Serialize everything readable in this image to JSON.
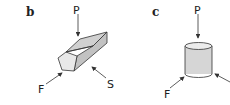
{
  "panels": [
    {
      "label": "b",
      "shape": "pentagonal-prism",
      "forces": {
        "top": "P",
        "left": "F",
        "right": "S"
      }
    },
    {
      "label": "c",
      "shape": "cylinder",
      "forces": {
        "top": "P",
        "left": "F"
      }
    }
  ],
  "colors": {
    "face_light": "#e6e6e6",
    "face_mid": "#cfcfcf",
    "face_dark": "#bdbdbd",
    "stroke": "#333333"
  }
}
